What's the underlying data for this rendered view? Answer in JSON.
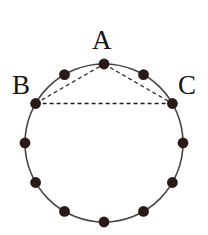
{
  "figure": {
    "background_color": "#ffffff",
    "circle": {
      "center_x": 104,
      "center_y": 143,
      "radius": 79,
      "stroke_color": "#4a4442",
      "stroke_width": 1.6,
      "fill": "none"
    },
    "points": {
      "count": 12,
      "spacing_degrees": 30,
      "dot_radius": 5.4,
      "dot_color": "#2a1a18",
      "items": [
        {
          "id": "p-a",
          "label": "A",
          "angle_deg": 90,
          "x": 104,
          "y": 64,
          "labeled": true
        },
        {
          "id": "p-1",
          "label": "",
          "angle_deg": 60,
          "x": 143.5,
          "y": 74.6,
          "labeled": false
        },
        {
          "id": "p-c",
          "label": "C",
          "angle_deg": 30,
          "x": 172.4,
          "y": 103.5,
          "labeled": true
        },
        {
          "id": "p-2",
          "label": "",
          "angle_deg": 0,
          "x": 183,
          "y": 143,
          "labeled": false
        },
        {
          "id": "p-3",
          "label": "",
          "angle_deg": 330,
          "x": 172.4,
          "y": 182.5,
          "labeled": false
        },
        {
          "id": "p-4",
          "label": "",
          "angle_deg": 300,
          "x": 143.5,
          "y": 211.4,
          "labeled": false
        },
        {
          "id": "p-5",
          "label": "",
          "angle_deg": 270,
          "x": 104,
          "y": 222,
          "labeled": false
        },
        {
          "id": "p-6",
          "label": "",
          "angle_deg": 240,
          "x": 64.5,
          "y": 211.4,
          "labeled": false
        },
        {
          "id": "p-7",
          "label": "",
          "angle_deg": 210,
          "x": 35.6,
          "y": 182.5,
          "labeled": false
        },
        {
          "id": "p-8",
          "label": "",
          "angle_deg": 180,
          "x": 25,
          "y": 143,
          "labeled": false
        },
        {
          "id": "p-b",
          "label": "B",
          "angle_deg": 150,
          "x": 35.6,
          "y": 103.5,
          "labeled": true
        },
        {
          "id": "p-9",
          "label": "",
          "angle_deg": 120,
          "x": 64.5,
          "y": 74.6,
          "labeled": false
        }
      ]
    },
    "triangle": {
      "vertices": [
        "A",
        "B",
        "C"
      ],
      "stroke_color": "#2a1a18",
      "stroke_width": 1.3,
      "dash_pattern": "4 3",
      "edges": [
        {
          "id": "edge-ab",
          "from": "B",
          "from_x": 35.6,
          "from_y": 103.5,
          "to": "A",
          "to_x": 104,
          "to_y": 64
        },
        {
          "id": "edge-ac",
          "from": "A",
          "from_x": 104,
          "from_y": 64,
          "to": "C",
          "to_x": 172.4,
          "to_y": 103.5
        },
        {
          "id": "edge-bc",
          "from": "B",
          "from_x": 35.6,
          "from_y": 103.5,
          "to": "C",
          "to_x": 172.4,
          "to_y": 103.5
        }
      ]
    },
    "labels": [
      {
        "id": "label-a",
        "text": "A",
        "left": 92,
        "top": 27,
        "font_size": 27
      },
      {
        "id": "label-b",
        "text": "B",
        "left": 12,
        "top": 72,
        "font_size": 27
      },
      {
        "id": "label-c",
        "text": "C",
        "left": 178,
        "top": 72,
        "font_size": 27
      }
    ]
  }
}
